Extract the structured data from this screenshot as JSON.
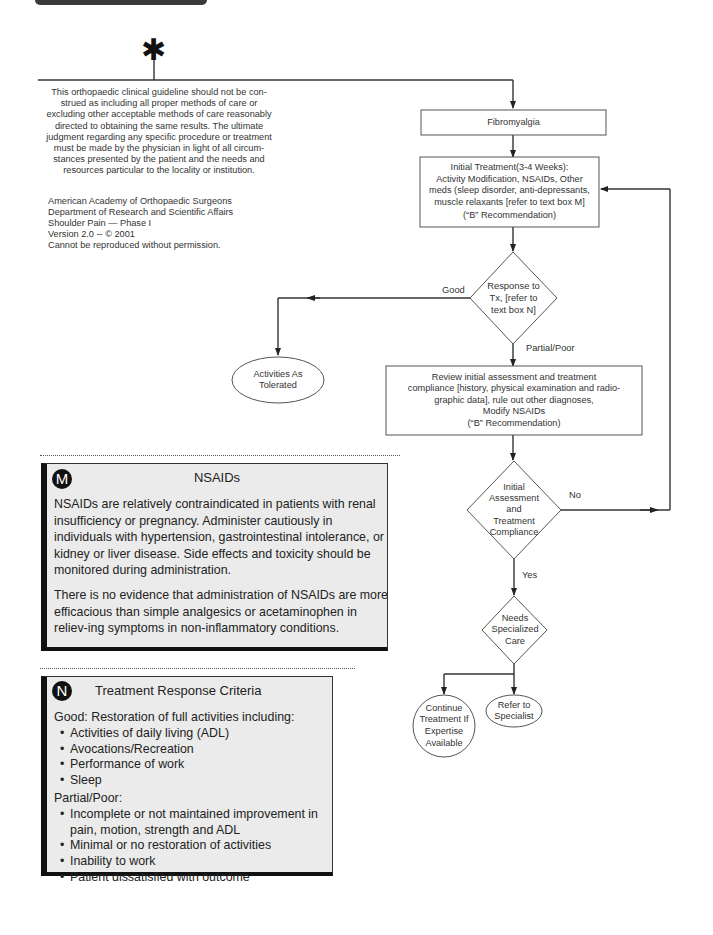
{
  "header": {
    "bar": "section-header-bar"
  },
  "start_marker": {
    "symbol": "✱",
    "icon": "asterisk-icon"
  },
  "disclaimer": {
    "lines": [
      "This orthopaedic clinical guideline should not be con-",
      "strued as including all proper methods of care or",
      "excluding other acceptable methods of care reasonably",
      "directed to obtaining the same results. The ultimate",
      "judgment regarding any specific procedure or treatment",
      "must be made by the physician in light of all circum-",
      "stances presented by the patient and the needs and",
      "resources particular to the locality or institution."
    ]
  },
  "credits": {
    "lines": [
      "American Academy of Orthopaedic Surgeons",
      "Department of Research and Scientific Affairs",
      "Shoulder Pain — Phase I",
      "Version 2.0 -- © 2001",
      "Cannot be reproduced without permission."
    ]
  },
  "flow": {
    "nodes": {
      "fibromyalgia": {
        "type": "process",
        "text": "Fibromyalgia"
      },
      "initial_treatment": {
        "type": "process",
        "lines": [
          "Initial Treatment(3-4 Weeks):",
          "Activity Modification, NSAIDs, Other",
          "meds (sleep disorder, anti-depressants,",
          "muscle relaxants  [refer to text box M]",
          "(“B” Recommendation)"
        ]
      },
      "response_to_tx": {
        "type": "decision",
        "lines": [
          "Response to",
          "Tx, [refer to",
          "text box N]"
        ]
      },
      "activities_as_tolerated": {
        "type": "terminal",
        "lines": [
          "Activities As",
          "Tolerated"
        ]
      },
      "review_assessment": {
        "type": "process",
        "lines": [
          "Review initial assessment and treatment",
          "compliance [history, physical examination and radio-",
          "graphic data], rule out other diagnoses,",
          "Modify NSAIDs",
          "(“B” Recommendation)"
        ]
      },
      "initial_assessment_compliance": {
        "type": "decision",
        "lines": [
          "Initial",
          "Assessment",
          "and",
          "Treatment",
          "Compliance"
        ]
      },
      "needs_specialized_care": {
        "type": "decision",
        "lines": [
          "Needs",
          "Specialized",
          "Care"
        ]
      },
      "continue_treatment": {
        "type": "terminal",
        "lines": [
          "Continue",
          "Treatment If",
          "Expertise",
          "Available"
        ]
      },
      "refer_to_specialist": {
        "type": "terminal",
        "lines": [
          "Refer to",
          "Specialist"
        ]
      }
    },
    "edge_labels": {
      "good": "Good",
      "partial_poor": "Partial/Poor",
      "no": "No",
      "yes": "Yes"
    }
  },
  "box_m": {
    "badge": "M",
    "title": "NSAIDs",
    "paragraphs": [
      "NSAIDs are relatively contraindicated in patients with renal insufficiency or pregnancy.  Administer cautiously in individuals with hypertension, gastrointestinal intolerance, or kidney or liver disease. Side effects and toxicity should be monitored during administration.",
      "There is no evidence that administration of NSAIDs are more efficacious than simple analgesics or acetaminophen in reliev-ing symptoms in non-inflammatory conditions."
    ]
  },
  "box_n": {
    "badge": "N",
    "title": "Treatment Response Criteria",
    "good_heading": "Good: Restoration of full activities including:",
    "good_items": [
      "Activities of daily living (ADL)",
      "Avocations/Recreation",
      "Performance of work",
      "Sleep"
    ],
    "poor_heading": "Partial/Poor:",
    "poor_items": [
      "Incomplete or not maintained improvement in pain, motion, strength and ADL",
      "Minimal or no restoration of activities",
      "Inability to work",
      "Patient dissatisfied with outcome"
    ]
  },
  "colors": {
    "line": "#333333",
    "callout_bg": "#ebebeb",
    "callout_border": "#111111"
  }
}
